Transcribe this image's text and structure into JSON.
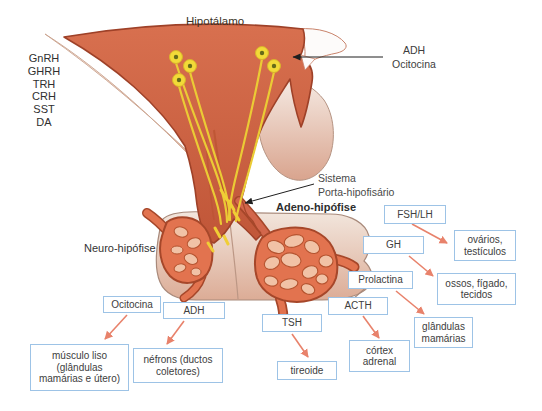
{
  "diagram": {
    "region_labels": {
      "hypothalamus": "Hipotálamo",
      "adeno_hypophysis": "Adeno-hipófise",
      "neuro_hypophysis": "Neuro-hipófise",
      "portal_system_line1": "Sistema",
      "portal_system_line2": "Porta-hipofisário",
      "posterior_hormones_line1": "ADH",
      "posterior_hormones_line2": "Ocitocina"
    },
    "hypothalamic_hormones": [
      "GnRH",
      "GHRH",
      "TRH",
      "CRH",
      "SST",
      "DA"
    ],
    "hormone_boxes": {
      "ocitocina": "Ocitocina",
      "adh": "ADH",
      "tsh": "TSH",
      "acth": "ACTH",
      "prolactina": "Prolactina",
      "gh": "GH",
      "fsh_lh": "FSH/LH"
    },
    "target_boxes": {
      "musculo_liso": "músculo liso (glândulas mamárias e útero)",
      "nefrons": "néfrons (ductos coletores)",
      "tireoide": "tireoide",
      "cortex_adrenal": "córtex adrenal",
      "glandulas_mamarias": "glândulas mamárias",
      "ossos_figado_tecidos": "ossos, fígado, tecidos",
      "ovarios_testiculos": "ovários, testículos"
    },
    "connections": [
      {
        "from": "Ocitocina",
        "to": "músculo liso (glândulas mamárias e útero)"
      },
      {
        "from": "ADH",
        "to": "néfrons (ductos coletores)"
      },
      {
        "from": "TSH",
        "to": "tireoide"
      },
      {
        "from": "ACTH",
        "to": "córtex adrenal"
      },
      {
        "from": "Prolactina",
        "to": "glândulas mamárias"
      },
      {
        "from": "GH",
        "to": "ossos, fígado, tecidos"
      },
      {
        "from": "FSH/LH",
        "to": "ovários, testículos"
      }
    ],
    "colors": {
      "tissue_main": "#D2664B",
      "tissue_outline": "#9E4128",
      "tissue_light": "#EFDFD4",
      "lobe_fill": "#E2734F",
      "lobe_patch": "#F1C2A6",
      "neuron_yellow": "#F2DA38",
      "box_border": "#9DC3E6",
      "arrow_orange": "#E8826B",
      "arrow_black": "#1F1F1F",
      "text": "#404040"
    }
  }
}
